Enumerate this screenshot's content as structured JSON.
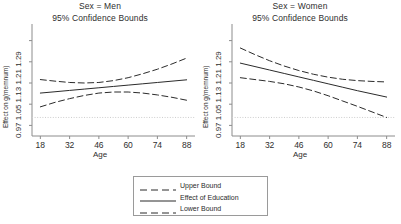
{
  "figure": {
    "background": "#ffffff",
    "line_color": "#2b2b2b",
    "reference_line_color": "#cccccc",
    "axis_color": "#8c8c8c"
  },
  "legend": {
    "items": [
      {
        "label": "Upper Bound",
        "style": "dashed"
      },
      {
        "label": "Effect of Education",
        "style": "solid"
      },
      {
        "label": "Lower Bound",
        "style": "dashed"
      }
    ]
  },
  "chart_data": [
    {
      "type": "line",
      "title": "Sex = Men",
      "subtitle": "95% Confidence Bounds",
      "xlabel": "Age",
      "ylabel": "Effect on g(memnum)",
      "xlim": [
        14,
        92
      ],
      "ylim": [
        0.93,
        1.33
      ],
      "xticks": [
        18,
        32,
        46,
        60,
        74,
        88
      ],
      "yticks": [
        0.97,
        1.05,
        1.13,
        1.21,
        1.29
      ],
      "ytick_labels": [
        "0.97",
        "1.05",
        "1.13",
        "1.21",
        "1.29"
      ],
      "grid": false,
      "reference_line_y": 1.0,
      "legend_position": "below-figure",
      "x": [
        18,
        25,
        32,
        39,
        46,
        53,
        60,
        67,
        74,
        81,
        88
      ],
      "series": [
        {
          "name": "Upper Bound",
          "style": "dashed",
          "values": [
            1.143,
            1.137,
            1.132,
            1.13,
            1.132,
            1.139,
            1.15,
            1.165,
            1.182,
            1.202,
            1.224
          ]
        },
        {
          "name": "Effect of Education",
          "style": "solid",
          "values": [
            1.092,
            1.097,
            1.102,
            1.107,
            1.112,
            1.117,
            1.122,
            1.127,
            1.132,
            1.137,
            1.142
          ]
        },
        {
          "name": "Lower Bound",
          "style": "dashed",
          "values": [
            1.04,
            1.057,
            1.071,
            1.083,
            1.092,
            1.096,
            1.096,
            1.092,
            1.085,
            1.076,
            1.065
          ]
        }
      ]
    },
    {
      "type": "line",
      "title": "Sex = Women",
      "subtitle": "95% Confidence Bounds",
      "xlabel": "Age",
      "ylabel": "Effect on g(memnum)",
      "xlim": [
        14,
        92
      ],
      "ylim": [
        0.93,
        1.33
      ],
      "xticks": [
        18,
        32,
        46,
        60,
        74,
        88
      ],
      "yticks": [
        0.97,
        1.05,
        1.13,
        1.21,
        1.29
      ],
      "ytick_labels": [
        "0.97",
        "1.05",
        "1.13",
        "1.21",
        "1.29"
      ],
      "grid": false,
      "reference_line_y": 1.0,
      "legend_position": "below-figure",
      "x": [
        18,
        25,
        32,
        39,
        46,
        53,
        60,
        67,
        74,
        81,
        88
      ],
      "series": [
        {
          "name": "Upper Bound",
          "style": "dashed",
          "values": [
            1.262,
            1.237,
            1.214,
            1.194,
            1.177,
            1.163,
            1.152,
            1.144,
            1.139,
            1.136,
            1.134
          ]
        },
        {
          "name": "Effect of Education",
          "style": "solid",
          "values": [
            1.205,
            1.192,
            1.179,
            1.166,
            1.153,
            1.14,
            1.127,
            1.114,
            1.101,
            1.089,
            1.077
          ]
        },
        {
          "name": "Lower Bound",
          "style": "dashed",
          "values": [
            1.15,
            1.143,
            1.136,
            1.127,
            1.115,
            1.1,
            1.082,
            1.062,
            1.042,
            1.021,
            1.0
          ]
        }
      ]
    }
  ]
}
